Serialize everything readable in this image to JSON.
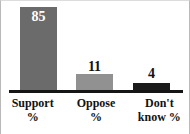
{
  "chart_data": {
    "type": "bar",
    "title": "",
    "subtitle": "",
    "xlabel": "",
    "ylabel": "",
    "categories": [
      "Support %",
      "Oppose %",
      "Don't know %"
    ],
    "values": [
      85,
      11,
      4
    ],
    "value_labels": [
      "85",
      "11",
      "4"
    ],
    "ylim": [
      0,
      85
    ],
    "grid": false,
    "legend": null,
    "bar_colors": [
      "#6b6b6b",
      "#919191",
      "#1b1b1b"
    ],
    "value_label_colors": [
      "#ffffff",
      "#111111",
      "#111111"
    ],
    "value_label_positions": [
      "inside-top",
      "above",
      "above"
    ],
    "axis_color": "#151515",
    "background": "#ffffff"
  },
  "categories": [
    {
      "id": "support",
      "line1": "Support",
      "line2": "%",
      "value": "85"
    },
    {
      "id": "oppose",
      "line1": "Oppose",
      "line2": "%",
      "value": "11"
    },
    {
      "id": "dontknow",
      "line1": "Don't",
      "line2": "know %",
      "value": "4"
    }
  ]
}
